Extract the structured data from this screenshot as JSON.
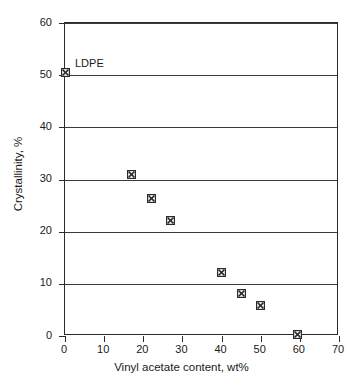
{
  "chart_data": {
    "type": "scatter",
    "title": "",
    "xlabel": "Vinyl acetate content, wt%",
    "ylabel": "Crystallinity, %",
    "xlim": [
      0,
      70
    ],
    "ylim": [
      0,
      60
    ],
    "xticks": [
      0,
      10,
      20,
      30,
      40,
      50,
      60,
      70
    ],
    "yticks": [
      0,
      10,
      20,
      30,
      40,
      50,
      60
    ],
    "xtick_labels": [
      "0",
      "10",
      "20",
      "30",
      "40",
      "50",
      "60",
      "70"
    ],
    "ytick_labels": [
      "0",
      "10",
      "20",
      "30",
      "40",
      "50",
      "60"
    ],
    "grid": "horizontal",
    "gridlines_y": [
      10,
      20,
      30,
      40,
      50,
      60
    ],
    "legend": null,
    "marker_style": "square-with-cross",
    "marker_color": "#2b2b2b",
    "series": [
      {
        "name": "EVA copolymer",
        "points": [
          {
            "x": 0,
            "y": 50.5
          },
          {
            "x": 17,
            "y": 31.0
          },
          {
            "x": 22,
            "y": 26.3
          },
          {
            "x": 27,
            "y": 22.2
          },
          {
            "x": 40,
            "y": 12.2
          },
          {
            "x": 45,
            "y": 8.2
          },
          {
            "x": 50,
            "y": 5.8
          },
          {
            "x": 59.5,
            "y": 0.3
          }
        ]
      }
    ],
    "annotations": [
      {
        "text": "LDPE",
        "x": 0,
        "y": 50.5,
        "dx": 10,
        "dy": -4
      }
    ]
  },
  "colors": {
    "axis": "#2b2b2b",
    "grid": "#3a3a3a",
    "marker": "#2b2b2b",
    "background": "#ffffff"
  }
}
